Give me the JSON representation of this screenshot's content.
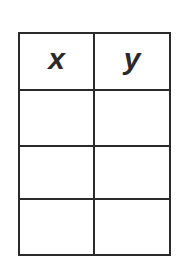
{
  "table": {
    "headers": [
      "x",
      "y"
    ],
    "rows": [
      [
        "",
        ""
      ],
      [
        "",
        ""
      ],
      [
        "",
        ""
      ]
    ]
  },
  "colors": {
    "line": "#2a2a2a",
    "background": "#ffffff"
  }
}
